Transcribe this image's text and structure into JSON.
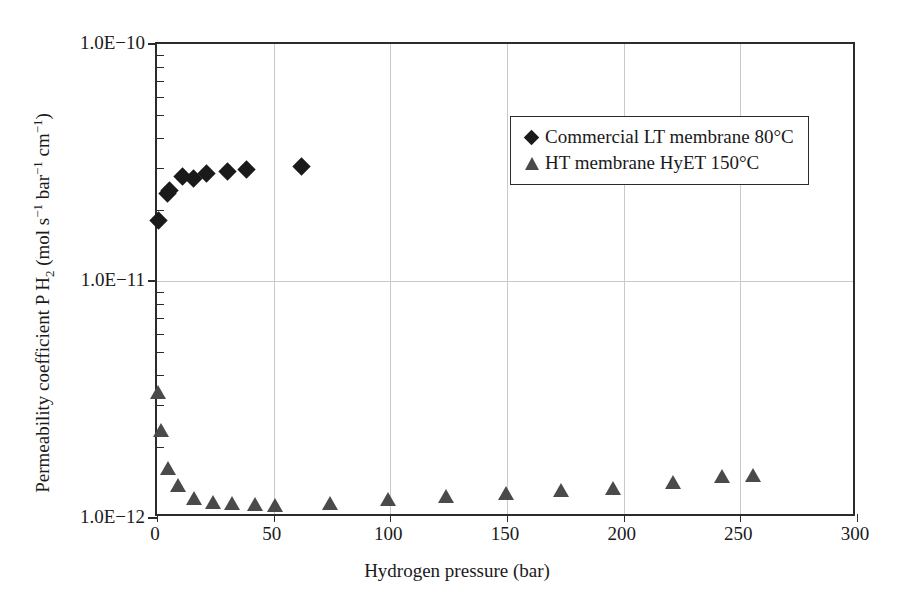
{
  "chart_data": {
    "type": "scatter",
    "title": "",
    "xlabel": "Hydrogen pressure (bar)",
    "ylabel_html": "Permeability coefficient P H<sub>2</sub> (mol s<sup>−1</sup> bar<sup>−1</sup> cm<sup>−1</sup>)",
    "ylabel_text": "Permeability coefficient P H2 (mol s-1 bar-1 cm-1)",
    "xlim": [
      0,
      300
    ],
    "ylim": [
      1e-12,
      1e-10
    ],
    "yscale": "log",
    "xscale": "linear",
    "grid": "vertical gridlines at x majors, horizontal gridline at 1.0E-11",
    "legend_position": "upper right inside axes",
    "xticks": [
      0,
      50,
      100,
      150,
      200,
      250,
      300
    ],
    "xticklabels": [
      "0",
      "50",
      "100",
      "150",
      "200",
      "250",
      "300"
    ],
    "yticks": [
      1e-10,
      1e-11,
      1e-12
    ],
    "yticklabels": [
      "1.0E−10",
      "1.0E−11",
      "1.0E−12"
    ],
    "series": [
      {
        "name": "Commercial LT membrane 80°C",
        "marker": "diamond",
        "color": "#1a1a1a",
        "points": [
          {
            "x": 0.5,
            "y": 1.8e-11
          },
          {
            "x": 4.5,
            "y": 2.35e-11
          },
          {
            "x": 5.5,
            "y": 2.4e-11
          },
          {
            "x": 11.0,
            "y": 2.75e-11
          },
          {
            "x": 15.5,
            "y": 2.72e-11
          },
          {
            "x": 21.0,
            "y": 2.85e-11
          },
          {
            "x": 30.0,
            "y": 2.9e-11
          },
          {
            "x": 38.5,
            "y": 2.95e-11
          },
          {
            "x": 62.0,
            "y": 3.05e-11
          }
        ]
      },
      {
        "name": "HT membrane HyET 150°C",
        "marker": "triangle",
        "color": "#4a4a4a",
        "points": [
          {
            "x": 0.5,
            "y": 3.4e-12
          },
          {
            "x": 1.5,
            "y": 2.35e-12
          },
          {
            "x": 4.5,
            "y": 1.62e-12
          },
          {
            "x": 9.0,
            "y": 1.38e-12
          },
          {
            "x": 16.0,
            "y": 1.22e-12
          },
          {
            "x": 24.0,
            "y": 1.17e-12
          },
          {
            "x": 32.0,
            "y": 1.16e-12
          },
          {
            "x": 42.0,
            "y": 1.15e-12
          },
          {
            "x": 50.5,
            "y": 1.14e-12
          },
          {
            "x": 74.0,
            "y": 1.16e-12
          },
          {
            "x": 99.0,
            "y": 1.2e-12
          },
          {
            "x": 124.0,
            "y": 1.24e-12
          },
          {
            "x": 149.5,
            "y": 1.28e-12
          },
          {
            "x": 173.0,
            "y": 1.31e-12
          },
          {
            "x": 195.5,
            "y": 1.34e-12
          },
          {
            "x": 221.0,
            "y": 1.42e-12
          },
          {
            "x": 242.0,
            "y": 1.5e-12
          },
          {
            "x": 255.5,
            "y": 1.52e-12
          }
        ]
      }
    ],
    "legend_entries": [
      {
        "label": "Commercial LT membrane 80°C",
        "marker": "diamond"
      },
      {
        "label": "HT membrane HyET 150°C",
        "marker": "triangle"
      }
    ]
  },
  "colors": {
    "series_lt": "#1a1a1a",
    "series_ht": "#4a4a4a",
    "axis": "#2b2b2b",
    "grid": "#c9c9c9",
    "background": "#ffffff"
  }
}
